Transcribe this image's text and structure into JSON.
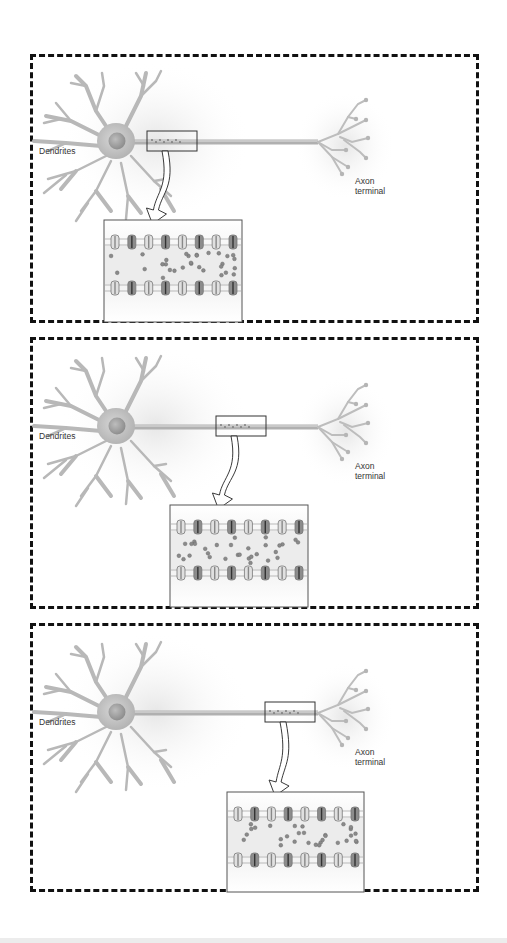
{
  "figure": {
    "panels": [
      {
        "stage": 1,
        "dendrites_label": "Dendrites",
        "axon_terminal_label": [
          "Axon",
          "terminal"
        ],
        "highlight_position": "proximal axon"
      },
      {
        "stage": 2,
        "dendrites_label": "Dendrites",
        "axon_terminal_label": [
          "Axon",
          "terminal"
        ],
        "highlight_position": "mid axon"
      },
      {
        "stage": 3,
        "dendrites_label": "Dendrites",
        "axon_terminal_label": [
          "Axon",
          "terminal"
        ],
        "highlight_position": "distal axon"
      }
    ],
    "inset": {
      "content": "axon membrane segment with ion channels and ions",
      "channels_per_row": 8
    },
    "colors": {
      "neuron": "#b8b8b8",
      "border": "#111111",
      "ion": "#8a8a8a",
      "channel_dark": "#555555"
    }
  }
}
